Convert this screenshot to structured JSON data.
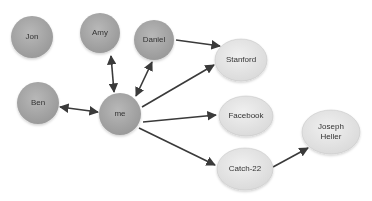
{
  "diagram": {
    "type": "social-graph",
    "nodes": [
      {
        "id": "jon",
        "label": "Jon",
        "style": "person"
      },
      {
        "id": "amy",
        "label": "Amy",
        "style": "person"
      },
      {
        "id": "daniel",
        "label": "Daniel",
        "style": "person"
      },
      {
        "id": "ben",
        "label": "Ben",
        "style": "person"
      },
      {
        "id": "me",
        "label": "me",
        "style": "person"
      },
      {
        "id": "stanford",
        "label": "Stanford",
        "style": "entity"
      },
      {
        "id": "facebook",
        "label": "Facebook",
        "style": "entity"
      },
      {
        "id": "catch22",
        "label": "Catch-22",
        "style": "entity"
      },
      {
        "id": "joseph_heller",
        "label_line1": "Joseph",
        "label_line2": "Heller",
        "style": "entity"
      }
    ],
    "edges": [
      {
        "from": "me",
        "to": "amy",
        "direction": "both"
      },
      {
        "from": "me",
        "to": "daniel",
        "direction": "both"
      },
      {
        "from": "me",
        "to": "ben",
        "direction": "both"
      },
      {
        "from": "daniel",
        "to": "stanford",
        "direction": "forward"
      },
      {
        "from": "me",
        "to": "stanford",
        "direction": "forward"
      },
      {
        "from": "me",
        "to": "facebook",
        "direction": "forward"
      },
      {
        "from": "me",
        "to": "catch22",
        "direction": "forward"
      },
      {
        "from": "catch22",
        "to": "joseph_heller",
        "direction": "forward"
      }
    ],
    "colors": {
      "person_fill": "#a9a9a9",
      "entity_fill": "#e6e6e6",
      "edge": "#3a3a3a",
      "label": "#333333"
    }
  }
}
